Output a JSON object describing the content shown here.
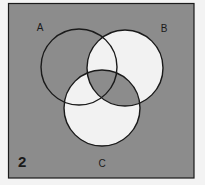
{
  "figure": {
    "number": "2",
    "type": "three-set Venn diagram with shaded regions"
  },
  "colors": {
    "page_background": "#f3f3f3",
    "shaded": "#8c8c8c",
    "unshaded": "#f2f2f2",
    "outline": "#1a1a1a"
  },
  "frame": {
    "x": 8,
    "y": 3,
    "width": 186,
    "height": 175
  },
  "sets": [
    {
      "id": "A",
      "label": "A",
      "cx": 79,
      "cy": 67,
      "r": 38,
      "label_x": 40,
      "label_y": 30
    },
    {
      "id": "B",
      "label": "B",
      "cx": 125,
      "cy": 68,
      "r": 38,
      "label_x": 164,
      "label_y": 31
    },
    {
      "id": "C",
      "label": "C",
      "cx": 102,
      "cy": 108,
      "r": 38,
      "label_x": 102,
      "label_y": 166
    }
  ],
  "regions": {
    "universe_outside": "shaded",
    "A_only": "shaded",
    "B_only": "unshaded",
    "C_only": "unshaded",
    "A_and_B_only": "unshaded",
    "A_and_C_only": "unshaded",
    "B_and_C_only": "shaded",
    "A_and_B_and_C": "shaded"
  }
}
